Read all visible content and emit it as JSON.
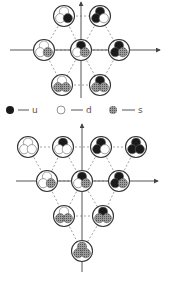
{
  "legend": {
    "items": [
      {
        "label": "u",
        "quark": "u"
      },
      {
        "label": "d",
        "quark": "d"
      },
      {
        "label": "s",
        "quark": "s"
      }
    ]
  },
  "colors": {
    "u": "#1a1a1a",
    "d": "#ffffff",
    "s": "#8a8a8a",
    "axis": "#555555",
    "dash": "#8a8a8a",
    "outline": "#333333"
  },
  "octet": {
    "title": "baryon octet",
    "particles": [
      {
        "pos": [
          64,
          16
        ],
        "quarks": [
          "d",
          "d",
          "u"
        ]
      },
      {
        "pos": [
          100,
          16
        ],
        "quarks": [
          "u",
          "u",
          "d"
        ]
      },
      {
        "pos": [
          44,
          50
        ],
        "quarks": [
          "d",
          "d",
          "s"
        ]
      },
      {
        "pos": [
          81,
          50
        ],
        "quarks": [
          "u",
          "d",
          "s"
        ]
      },
      {
        "pos": [
          119,
          50
        ],
        "quarks": [
          "u",
          "u",
          "s"
        ]
      },
      {
        "pos": [
          62,
          85
        ],
        "quarks": [
          "d",
          "s",
          "s"
        ]
      },
      {
        "pos": [
          100,
          85
        ],
        "quarks": [
          "u",
          "s",
          "s"
        ]
      }
    ]
  },
  "decuplet": {
    "title": "baryon decuplet",
    "particles": [
      {
        "pos": [
          28,
          147
        ],
        "quarks": [
          "d",
          "d",
          "d"
        ]
      },
      {
        "pos": [
          63,
          147
        ],
        "quarks": [
          "u",
          "d",
          "d"
        ]
      },
      {
        "pos": [
          101,
          147
        ],
        "quarks": [
          "u",
          "u",
          "d"
        ]
      },
      {
        "pos": [
          136,
          147
        ],
        "quarks": [
          "u",
          "u",
          "u"
        ]
      },
      {
        "pos": [
          47,
          181
        ],
        "quarks": [
          "d",
          "d",
          "s"
        ]
      },
      {
        "pos": [
          82,
          181
        ],
        "quarks": [
          "u",
          "d",
          "s"
        ]
      },
      {
        "pos": [
          119,
          181
        ],
        "quarks": [
          "u",
          "u",
          "s"
        ]
      },
      {
        "pos": [
          64,
          216
        ],
        "quarks": [
          "d",
          "s",
          "s"
        ]
      },
      {
        "pos": [
          103,
          216
        ],
        "quarks": [
          "u",
          "s",
          "s"
        ]
      },
      {
        "pos": [
          82,
          251
        ],
        "quarks": [
          "s",
          "s",
          "s"
        ]
      }
    ]
  }
}
